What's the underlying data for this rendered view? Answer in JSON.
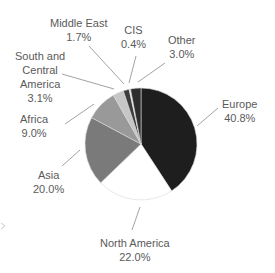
{
  "chart_data": {
    "type": "pie",
    "title": "",
    "start_angle": "12 o'clock, clockwise",
    "slices": [
      {
        "label": "Europe",
        "value": 40.8,
        "display": "40.8%",
        "color": "#1e1e1e"
      },
      {
        "label": "North America",
        "value": 22.0,
        "display": "22.0%",
        "color": "#ffffff"
      },
      {
        "label": "Asia",
        "value": 20.0,
        "display": "20.0%",
        "color": "#7a7a7a"
      },
      {
        "label": "Africa",
        "value": 9.0,
        "display": "9.0%",
        "color": "#999999"
      },
      {
        "label": "South and Central America",
        "value": 3.1,
        "display": "3.1%",
        "color": "#c6c6c6"
      },
      {
        "label": "Middle East",
        "value": 1.7,
        "display": "1.7%",
        "color": "#3c3c3c"
      },
      {
        "label": "CIS",
        "value": 0.4,
        "display": "0.4%",
        "color": "#f2f2f2"
      },
      {
        "label": "Other",
        "value": 3.0,
        "display": "3.0%",
        "color": "#2d2d2d"
      }
    ]
  },
  "labels": {
    "europe": {
      "name": "Europe",
      "pct": "40.8%"
    },
    "north_america": {
      "name": "North America",
      "pct": "22.0%"
    },
    "asia": {
      "name": "Asia",
      "pct": "20.0%"
    },
    "africa": {
      "name": "Africa",
      "pct": "9.0%"
    },
    "south_central_america": {
      "name1": "South and",
      "name2": "Central",
      "name3": "America",
      "pct": "3.1%"
    },
    "middle_east": {
      "name": "Middle East",
      "pct": "1.7%"
    },
    "cis": {
      "name": "CIS",
      "pct": "0.4%"
    },
    "other": {
      "name": "Other",
      "pct": "3.0%"
    }
  }
}
